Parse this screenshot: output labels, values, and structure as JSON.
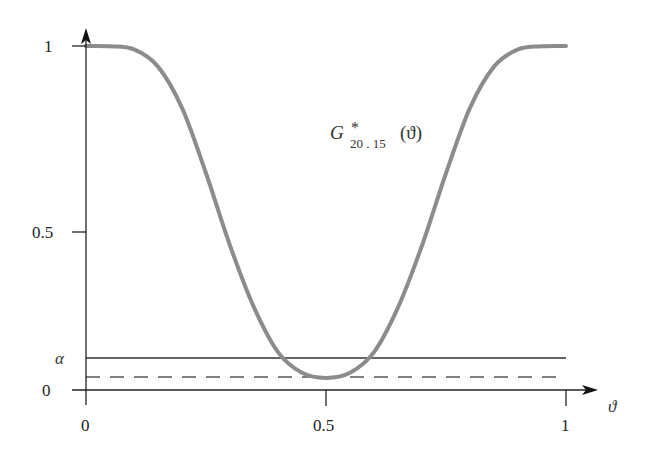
{
  "chart_data": {
    "type": "line",
    "title": "",
    "xlabel": "ϑ",
    "ylabel": "",
    "xlim": [
      0,
      1
    ],
    "ylim": [
      0,
      1
    ],
    "grid": false,
    "x_ticks": [
      "0",
      "0.5",
      "1"
    ],
    "y_ticks": [
      "0",
      "α",
      "0.5",
      "1"
    ],
    "series": [
      {
        "name": "G*_{20,15}(ϑ)",
        "style": "solid thick gray",
        "color": "#8c8c8c",
        "x": [
          0.0,
          0.05,
          0.1,
          0.15,
          0.2,
          0.25,
          0.3,
          0.35,
          0.4,
          0.45,
          0.5,
          0.55,
          0.6,
          0.65,
          0.7,
          0.75,
          0.8,
          0.85,
          0.9,
          0.95,
          1.0
        ],
        "values": [
          1.0,
          0.999,
          0.99,
          0.94,
          0.82,
          0.63,
          0.42,
          0.24,
          0.11,
          0.05,
          0.035,
          0.05,
          0.11,
          0.24,
          0.42,
          0.63,
          0.82,
          0.94,
          0.99,
          0.999,
          1.0
        ]
      },
      {
        "name": "α",
        "style": "solid thin black",
        "color": "#333333",
        "x": [
          0,
          1
        ],
        "values": [
          0.09,
          0.09
        ]
      },
      {
        "name": "minimum level",
        "style": "dashed",
        "color": "#555555",
        "x": [
          0,
          1
        ],
        "values": [
          0.035,
          0.035
        ]
      }
    ],
    "annotations": [
      {
        "text": "G*20,15(ϑ)",
        "x": 0.6,
        "y": 0.8
      }
    ]
  },
  "labels": {
    "y_tick_1": "1",
    "y_tick_05": "0.5",
    "y_tick_alpha": "α",
    "y_tick_0": "0",
    "x_tick_0": "0",
    "x_tick_05": "0.5",
    "x_tick_1": "1",
    "x_axis_label": "ϑ",
    "curve_label_main": "G",
    "curve_label_sup": "*",
    "curve_label_sub": "20 . 15",
    "curve_label_arg": "(ϑ)"
  }
}
